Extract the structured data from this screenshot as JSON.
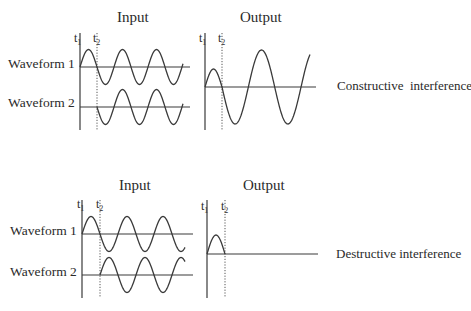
{
  "panels": [
    {
      "id": "constructive",
      "input_title": "Input",
      "output_title": "Output",
      "result_label": "Constructive  interference",
      "waveform_labels": [
        "Waveform 1",
        "Waveform 2"
      ],
      "time_markers": {
        "t1": "t",
        "t1_sub": "1",
        "t2": "t",
        "t2_sub": "2"
      },
      "geometry": {
        "input_axis_x": 80,
        "t2_x": 97,
        "axis_top": 33,
        "axis_bottom": 130,
        "w1_base": 67,
        "w2_base": 107,
        "baseline_end": 190,
        "amp": 17.5,
        "period": 34,
        "w1_start": 80,
        "w1_end": 183,
        "w1_phase": 0,
        "w2_start": 97,
        "w2_end": 183,
        "w2_phase": 180,
        "out_axis_x": 205,
        "out_t2_x": 222,
        "out_base": 87,
        "out_end": 316,
        "out_axis_top": 33,
        "out_axis_bottom": 130,
        "out_small_amp": 18,
        "out_big_amp": 37,
        "out_wave_end": 310
      }
    },
    {
      "id": "destructive",
      "input_title": "Input",
      "output_title": "Output",
      "result_label": "Destructive interference",
      "waveform_labels": [
        "Waveform 1",
        "Waveform 2"
      ],
      "time_markers": {
        "t1": "t",
        "t1_sub": "1",
        "t2": "t",
        "t2_sub": "2"
      },
      "geometry": {
        "input_axis_x": 82,
        "t2_x": 100,
        "axis_top": 200,
        "axis_bottom": 298,
        "w1_base": 234,
        "w2_base": 275,
        "baseline_end": 193,
        "amp": 17.5,
        "period": 36,
        "w1_start": 82,
        "w1_end": 185,
        "w1_phase": 0,
        "w2_start": 100,
        "w2_end": 185,
        "w2_phase": 0,
        "out_axis_x": 207,
        "out_t2_x": 225,
        "out_base": 254,
        "out_end": 318,
        "out_axis_top": 200,
        "out_axis_bottom": 298,
        "out_small_amp": 19,
        "out_big_amp": 0,
        "out_wave_end": 225
      }
    }
  ],
  "colors": {
    "ink": "#3a3a3a",
    "text": "#2a2a2a",
    "background": "#ffffff"
  }
}
